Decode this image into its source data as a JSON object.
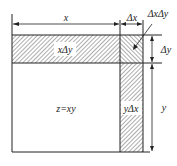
{
  "diagram": {
    "labels": {
      "x": "x",
      "dx": "Δx",
      "dxdy": "ΔxΔy",
      "dy": "Δy",
      "y": "y",
      "x_dy": "xΔy",
      "y_dx": "yΔx",
      "z": "z=xy"
    },
    "colors": {
      "line": "#222222",
      "hatch": "#333333",
      "background": "#ffffff"
    }
  }
}
